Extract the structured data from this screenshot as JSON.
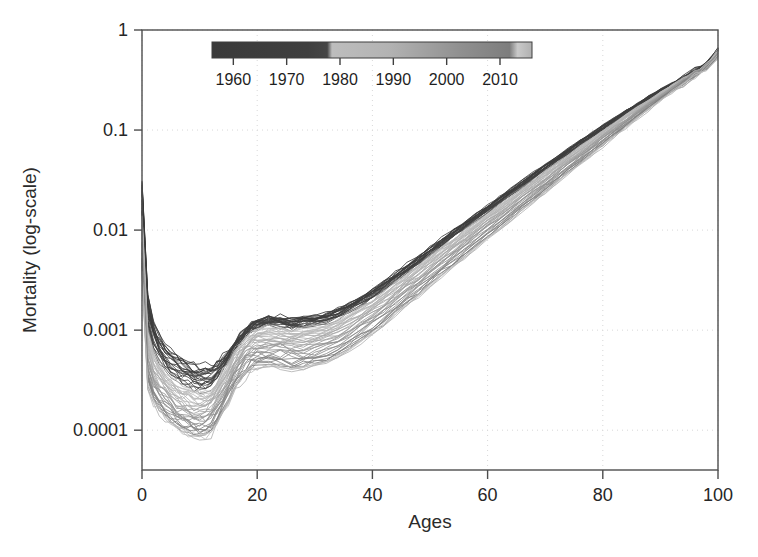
{
  "chart_data": {
    "type": "line",
    "title": "",
    "subtitle": "",
    "xlabel": "Ages",
    "ylabel": "Mortality (log-scale)",
    "yscale": "log",
    "xlim": [
      0,
      100
    ],
    "ylim": [
      4e-05,
      1.0
    ],
    "grid": true,
    "x_ticks": [
      0,
      20,
      40,
      60,
      80,
      100
    ],
    "x_tick_labels": [
      "0",
      "20",
      "40",
      "60",
      "80",
      "100"
    ],
    "y_ticks": [
      1,
      0.1,
      0.01,
      0.001,
      0.0001
    ],
    "y_tick_labels": [
      "1",
      "0.1",
      "0.01",
      "0.001",
      "0.0001"
    ],
    "legend": {
      "type": "colorbar-gradient",
      "position": "inside-top",
      "orientation": "horizontal",
      "title": "",
      "ticks": [
        1960,
        1970,
        1980,
        1990,
        2000,
        2010
      ],
      "tick_labels": [
        "1960",
        "1970",
        "1980",
        "1990",
        "2000",
        "2010"
      ],
      "range": [
        1956,
        2016
      ],
      "colormap": "grayscale-dark-to-light",
      "stops": [
        {
          "pos": 0.0,
          "color": "#3a3a3a"
        },
        {
          "pos": 0.3,
          "color": "#3f3f3f"
        },
        {
          "pos": 0.36,
          "color": "#464646"
        },
        {
          "pos": 0.375,
          "color": "#bdbdbd"
        },
        {
          "pos": 0.55,
          "color": "#b3b3b3"
        },
        {
          "pos": 0.78,
          "color": "#8f8f8f"
        },
        {
          "pos": 0.93,
          "color": "#7d7d7d"
        },
        {
          "pos": 0.955,
          "color": "#c9c9c9"
        },
        {
          "pos": 1.0,
          "color": "#b0b0b0"
        }
      ]
    },
    "series_description": "One mortality curve per calendar year from 1956 to 2016; line gray level encodes year (dark = early years, light = recent years). Mortality declines over calendar time at every age.",
    "series_years": [
      1956,
      1957,
      1958,
      1959,
      1960,
      1961,
      1962,
      1963,
      1964,
      1965,
      1966,
      1967,
      1968,
      1969,
      1970,
      1971,
      1972,
      1973,
      1974,
      1975,
      1976,
      1977,
      1978,
      1979,
      1980,
      1981,
      1982,
      1983,
      1984,
      1985,
      1986,
      1987,
      1988,
      1989,
      1990,
      1991,
      1992,
      1993,
      1994,
      1995,
      1996,
      1997,
      1998,
      1999,
      2000,
      2001,
      2002,
      2003,
      2004,
      2005,
      2006,
      2007,
      2008,
      2009,
      2010,
      2011,
      2012,
      2013,
      2014,
      2015,
      2016
    ],
    "x": [
      0,
      1,
      2,
      3,
      4,
      5,
      6,
      7,
      8,
      9,
      10,
      11,
      12,
      13,
      14,
      15,
      16,
      17,
      18,
      19,
      20,
      22,
      24,
      26,
      28,
      30,
      32,
      34,
      36,
      38,
      40,
      42,
      44,
      46,
      48,
      50,
      52,
      54,
      56,
      58,
      60,
      62,
      64,
      66,
      68,
      70,
      72,
      74,
      76,
      78,
      80,
      82,
      84,
      86,
      88,
      90,
      92,
      94,
      96,
      98,
      100
    ],
    "series": [
      {
        "name": "1956 (earliest, darkest)",
        "year": 1956,
        "color": "#3a3a3a",
        "values": [
          0.03,
          0.0023,
          0.0012,
          0.0009,
          0.00074,
          0.00063,
          0.00056,
          0.00051,
          0.00047,
          0.00045,
          0.00044,
          0.00043,
          0.00044,
          0.00047,
          0.00053,
          0.00062,
          0.00074,
          0.00088,
          0.00103,
          0.00115,
          0.00124,
          0.00132,
          0.00133,
          0.00132,
          0.00133,
          0.00138,
          0.00148,
          0.00163,
          0.00185,
          0.00215,
          0.00255,
          0.00305,
          0.00368,
          0.00447,
          0.00545,
          0.00665,
          0.0081,
          0.00985,
          0.01195,
          0.0145,
          0.0176,
          0.02135,
          0.0258,
          0.0312,
          0.0376,
          0.0452,
          0.0543,
          0.0651,
          0.078,
          0.0932,
          0.111,
          0.132,
          0.156,
          0.184,
          0.216,
          0.253,
          0.295,
          0.343,
          0.397,
          0.458,
          0.66
        ]
      },
      {
        "name": "1966",
        "year": 1966,
        "color": "#414141",
        "values": [
          0.022,
          0.00168,
          0.00092,
          0.0007,
          0.00058,
          0.0005,
          0.00045,
          0.00041,
          0.00038,
          0.00036,
          0.00035,
          0.00035,
          0.00036,
          0.0004,
          0.00046,
          0.00056,
          0.00069,
          0.00083,
          0.00098,
          0.0011,
          0.00118,
          0.00124,
          0.00124,
          0.00122,
          0.00122,
          0.00127,
          0.00136,
          0.0015,
          0.00171,
          0.00199,
          0.00236,
          0.00283,
          0.00342,
          0.00416,
          0.00508,
          0.0062,
          0.00757,
          0.00921,
          0.0112,
          0.0136,
          0.0165,
          0.02,
          0.0242,
          0.0293,
          0.0354,
          0.0426,
          0.0513,
          0.0616,
          0.0739,
          0.0885,
          0.106,
          0.126,
          0.15,
          0.178,
          0.21,
          0.246,
          0.288,
          0.335,
          0.388,
          0.448,
          0.64
        ]
      },
      {
        "name": "1976",
        "year": 1976,
        "color": "#4a4a4a",
        "values": [
          0.015,
          0.0011,
          0.00066,
          0.00052,
          0.00044,
          0.00038,
          0.00034,
          0.00031,
          0.00029,
          0.00028,
          0.00027,
          0.00027,
          0.00029,
          0.00033,
          0.0004,
          0.0005,
          0.00063,
          0.00077,
          0.00091,
          0.00102,
          0.00109,
          0.00113,
          0.00112,
          0.0011,
          0.0011,
          0.00114,
          0.00122,
          0.00136,
          0.00155,
          0.00181,
          0.00215,
          0.00259,
          0.00314,
          0.00383,
          0.00468,
          0.00572,
          0.00699,
          0.00852,
          0.0104,
          0.0126,
          0.0153,
          0.0186,
          0.0226,
          0.0274,
          0.0331,
          0.04,
          0.0483,
          0.0582,
          0.07,
          0.0841,
          0.101,
          0.121,
          0.144,
          0.171,
          0.203,
          0.239,
          0.28,
          0.327,
          0.38,
          0.44,
          0.62
        ]
      },
      {
        "name": "1980",
        "year": 1980,
        "color": "#bcbcbc",
        "values": [
          0.0124,
          0.0009,
          0.00056,
          0.00044,
          0.00037,
          0.00032,
          0.00029,
          0.00026,
          0.00025,
          0.00024,
          0.00023,
          0.00023,
          0.00025,
          0.00029,
          0.00036,
          0.00045,
          0.00057,
          0.0007,
          0.00083,
          0.00093,
          0.00099,
          0.00102,
          0.00101,
          0.00099,
          0.00099,
          0.00103,
          0.00111,
          0.00124,
          0.00142,
          0.00166,
          0.00198,
          0.00239,
          0.00291,
          0.00356,
          0.00436,
          0.00534,
          0.00654,
          0.00799,
          0.00975,
          0.0119,
          0.0144,
          0.0175,
          0.0213,
          0.0259,
          0.0314,
          0.038,
          0.046,
          0.0556,
          0.0671,
          0.0808,
          0.0974,
          0.117,
          0.14,
          0.167,
          0.198,
          0.234,
          0.275,
          0.322,
          0.375,
          0.435,
          0.6
        ]
      },
      {
        "name": "1990",
        "year": 1990,
        "color": "#ababab",
        "values": [
          0.009,
          0.00066,
          0.00042,
          0.00034,
          0.00029,
          0.00025,
          0.00022,
          0.0002,
          0.00019,
          0.00018,
          0.00018,
          0.00018,
          0.0002,
          0.00024,
          0.0003,
          0.00038,
          0.00048,
          0.00059,
          0.0007,
          0.00078,
          0.00083,
          0.00085,
          0.00084,
          0.00082,
          0.00082,
          0.00086,
          0.00093,
          0.00104,
          0.0012,
          0.00141,
          0.00169,
          0.00205,
          0.00251,
          0.00308,
          0.00379,
          0.00466,
          0.00572,
          0.00701,
          0.00858,
          0.0105,
          0.0128,
          0.0156,
          0.0191,
          0.0233,
          0.0284,
          0.0346,
          0.042,
          0.0511,
          0.062,
          0.0752,
          0.0912,
          0.11,
          0.133,
          0.16,
          0.191,
          0.227,
          0.269,
          0.317,
          0.371,
          0.432,
          0.58
        ]
      },
      {
        "name": "2000",
        "year": 2000,
        "color": "#949494",
        "values": [
          0.0062,
          0.00046,
          0.0003,
          0.00024,
          0.00021,
          0.00018,
          0.00016,
          0.00015,
          0.00014,
          0.00013,
          0.00013,
          0.00013,
          0.00015,
          0.00018,
          0.00023,
          0.00029,
          0.00037,
          0.00046,
          0.00055,
          0.00061,
          0.00065,
          0.00066,
          0.00065,
          0.00064,
          0.00064,
          0.00067,
          0.00073,
          0.00082,
          0.00095,
          0.00113,
          0.00136,
          0.00166,
          0.00204,
          0.00252,
          0.00312,
          0.00385,
          0.00475,
          0.00585,
          0.0072,
          0.00885,
          0.0109,
          0.0133,
          0.0164,
          0.0201,
          0.0246,
          0.0302,
          0.0369,
          0.0452,
          0.0552,
          0.0674,
          0.0823,
          0.1,
          0.122,
          0.148,
          0.179,
          0.215,
          0.257,
          0.306,
          0.362,
          0.425,
          0.56
        ]
      },
      {
        "name": "2010",
        "year": 2010,
        "color": "#808080",
        "values": [
          0.0044,
          0.00032,
          0.00021,
          0.00017,
          0.00015,
          0.00013,
          0.00012,
          0.00011,
          0.0001,
          9.5e-05,
          9.2e-05,
          9.4e-05,
          0.000105,
          0.00013,
          0.000168,
          0.000215,
          0.000272,
          0.000334,
          0.000395,
          0.000442,
          0.000468,
          0.000477,
          0.00047,
          0.000461,
          0.000462,
          0.000484,
          0.000528,
          0.000597,
          0.000695,
          0.00083,
          0.00101,
          0.00124,
          0.00154,
          0.00192,
          0.0024,
          0.00299,
          0.00372,
          0.00462,
          0.00573,
          0.00709,
          0.00878,
          0.0108,
          0.0134,
          0.0166,
          0.0205,
          0.0254,
          0.0314,
          0.0388,
          0.0479,
          0.0592,
          0.073,
          0.09,
          0.111,
          0.136,
          0.167,
          0.203,
          0.246,
          0.296,
          0.354,
          0.419,
          0.54
        ]
      },
      {
        "name": "2016 (latest, lightest)",
        "year": 2016,
        "color": "#c4c4c4",
        "values": [
          0.0037,
          0.00027,
          0.00018,
          0.00015,
          0.00013,
          0.000115,
          0.000103,
          9.4e-05,
          8.7e-05,
          8.2e-05,
          7.9e-05,
          8.1e-05,
          9.1e-05,
          0.000114,
          0.000148,
          0.00019,
          0.000241,
          0.000296,
          0.00035,
          0.000392,
          0.000415,
          0.000423,
          0.000417,
          0.000409,
          0.00041,
          0.00043,
          0.00047,
          0.000532,
          0.00062,
          0.000742,
          0.000905,
          0.001115,
          0.001385,
          0.00173,
          0.00217,
          0.00271,
          0.00338,
          0.00421,
          0.00523,
          0.00649,
          0.00805,
          0.00995,
          0.0123,
          0.0153,
          0.0189,
          0.0235,
          0.0292,
          0.0362,
          0.0449,
          0.0557,
          0.069,
          0.0854,
          0.105,
          0.13,
          0.16,
          0.196,
          0.239,
          0.289,
          0.348,
          0.414,
          0.52
        ]
      }
    ],
    "notes": [
      "Infant mortality spike at age 0 (~0.03 earliest year down to ~0.004 latest year)",
      "Minimum mortality around ages 10-12",
      "Accident hump visible around ages 20-25 for earlier (darker) years",
      "Near-linear log-scale rise from about age 35 to age 100",
      "Curves converge near age 100 at roughly 0.5-0.7"
    ]
  },
  "plot_geometry": {
    "left": 142,
    "right": 718,
    "top": 30,
    "bottom": 470
  },
  "legend_geometry": {
    "bar_left": 212,
    "bar_right": 532,
    "bar_top": 42,
    "bar_bottom": 58,
    "label_y": 80
  },
  "colors": {
    "frame": "#4d4d4d",
    "grid": "#d8d8d8",
    "text": "#262626",
    "background": "#ffffff"
  }
}
